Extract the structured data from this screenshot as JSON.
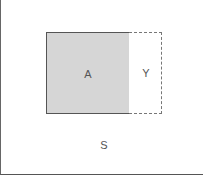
{
  "diagram": {
    "universe_label": "S",
    "set_a_label": "A",
    "region_y_label": "Y",
    "colors": {
      "set_a_fill": "#d6d6d6",
      "stroke": "#555555",
      "background": "#ffffff"
    }
  }
}
